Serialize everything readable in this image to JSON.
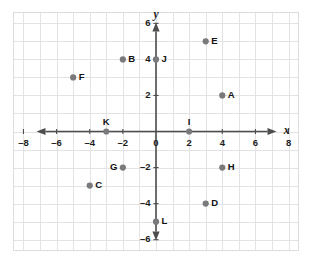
{
  "figure": {
    "title": "",
    "background_color": "#ffffff",
    "grid_color": "#e3e3e6",
    "axis_color": "#4d4d4d",
    "point_color": "#7a7a7d",
    "label_color": "#111111"
  },
  "chart_data": {
    "type": "scatter",
    "title": "",
    "xlabel": "x",
    "ylabel": "y",
    "xlim": [
      -8.6,
      8.6
    ],
    "ylim": [
      -6.6,
      6.6
    ],
    "grid": true,
    "grid_step": 1,
    "legend": "none",
    "xticks": [
      -8,
      -6,
      -4,
      -2,
      0,
      2,
      4,
      6,
      8
    ],
    "xtick_labels": [
      "–8",
      "–6",
      "–4",
      "–2",
      "0",
      "2",
      "4",
      "6",
      "8"
    ],
    "yticks": [
      -6,
      -4,
      -2,
      2,
      4,
      6
    ],
    "ytick_labels": [
      "–6",
      "–4",
      "–2",
      "2",
      "4",
      "6"
    ],
    "points": [
      {
        "label": "A",
        "x": 4,
        "y": 2,
        "label_pos": "right"
      },
      {
        "label": "B",
        "x": -2,
        "y": 4,
        "label_pos": "right"
      },
      {
        "label": "C",
        "x": -4,
        "y": -3,
        "label_pos": "right"
      },
      {
        "label": "D",
        "x": 3,
        "y": -4,
        "label_pos": "right"
      },
      {
        "label": "E",
        "x": 3,
        "y": 5,
        "label_pos": "right"
      },
      {
        "label": "F",
        "x": -5,
        "y": 3,
        "label_pos": "right"
      },
      {
        "label": "G",
        "x": -2,
        "y": -2,
        "label_pos": "left"
      },
      {
        "label": "H",
        "x": 4,
        "y": -2,
        "label_pos": "right"
      },
      {
        "label": "I",
        "x": 2,
        "y": 0,
        "label_pos": "above"
      },
      {
        "label": "J",
        "x": 0,
        "y": 4,
        "label_pos": "right"
      },
      {
        "label": "K",
        "x": -3,
        "y": 0,
        "label_pos": "above"
      },
      {
        "label": "L",
        "x": 0,
        "y": -5,
        "label_pos": "right"
      }
    ]
  }
}
